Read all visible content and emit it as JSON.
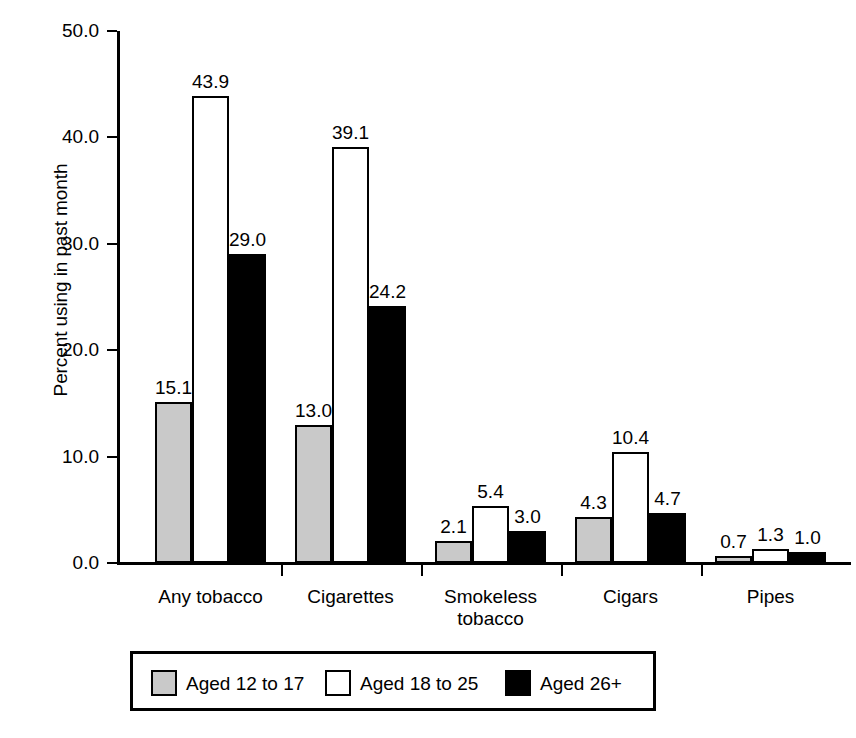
{
  "chart_data": {
    "type": "bar",
    "title": "",
    "xlabel": "",
    "ylabel": "Percent using in past month",
    "ylim": [
      0,
      50
    ],
    "ytick_labels": [
      "0.0",
      "10.0",
      "20.0",
      "30.0",
      "40.0",
      "50.0"
    ],
    "ytick_values": [
      0,
      10,
      20,
      30,
      40,
      50
    ],
    "grid": false,
    "legend_position": "bottom",
    "categories": [
      "Any tobacco",
      "Cigarettes",
      "Smokeless\ntobacco",
      "Cigars",
      "Pipes"
    ],
    "series": [
      {
        "name": "Aged 12 to 17",
        "color": "#c9c9c9",
        "values": [
          15.1,
          13.0,
          2.1,
          4.3,
          0.7
        ],
        "labels": [
          "15.1",
          "13.0",
          "2.1",
          "4.3",
          "0.7"
        ]
      },
      {
        "name": "Aged 18 to 25",
        "color": "#ffffff",
        "values": [
          43.9,
          39.1,
          5.4,
          10.4,
          1.3
        ],
        "labels": [
          "43.9",
          "39.1",
          "5.4",
          "10.4",
          "1.3"
        ]
      },
      {
        "name": "Aged 26+",
        "color": "#000000",
        "values": [
          29.0,
          24.2,
          3.0,
          4.7,
          1.0
        ],
        "labels": [
          "29.0",
          "24.2",
          "3.0",
          "4.7",
          "1.0"
        ]
      }
    ]
  },
  "legend": {
    "entries": [
      {
        "label": "Aged 12 to 17",
        "swatch": "gray"
      },
      {
        "label": "Aged 18 to 25",
        "swatch": "white"
      },
      {
        "label": "Aged 26+",
        "swatch": "black"
      }
    ]
  }
}
